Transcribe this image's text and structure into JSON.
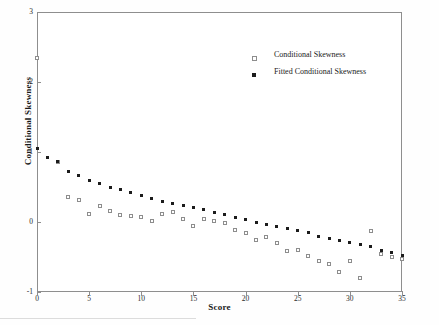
{
  "chart_data": {
    "type": "scatter",
    "title": "",
    "xlabel": "Score",
    "ylabel": "Conditional Skewness",
    "xlim": [
      0,
      35
    ],
    "ylim": [
      -1,
      3
    ],
    "xticks": [
      0,
      5,
      10,
      15,
      20,
      25,
      30,
      35
    ],
    "yticks": [
      -1,
      0,
      1,
      2,
      3
    ],
    "xtick_labels": [
      "0",
      "5",
      "10",
      "15",
      "20",
      "25",
      "30",
      "35"
    ],
    "ytick_labels": [
      "-1",
      "0",
      "1",
      "2",
      "3"
    ],
    "grid": false,
    "legend_position": "upper-center-right",
    "series": [
      {
        "name": "Conditional Skewness",
        "marker": "open-square",
        "color": "#8d8d8d",
        "x": [
          0,
          2,
          3,
          4,
          5,
          6,
          7,
          8,
          9,
          10,
          11,
          12,
          13,
          14,
          15,
          16,
          17,
          18,
          19,
          20,
          21,
          22,
          23,
          24,
          25,
          26,
          27,
          28,
          29,
          30,
          31,
          32,
          33,
          34,
          35
        ],
        "y": [
          2.35,
          0.86,
          0.36,
          0.31,
          0.12,
          0.23,
          0.16,
          0.1,
          0.09,
          0.07,
          0.01,
          0.11,
          0.14,
          0.04,
          -0.05,
          0.05,
          0.02,
          -0.01,
          -0.12,
          -0.15,
          -0.25,
          -0.22,
          -0.3,
          -0.42,
          -0.4,
          -0.48,
          -0.56,
          -0.6,
          -0.72,
          -0.56,
          -0.8,
          -0.13,
          -0.46,
          -0.5,
          -0.53
        ]
      },
      {
        "name": "Fitted Conditional Skewness",
        "marker": "filled-square",
        "color": "#1c1c1c",
        "x": [
          0,
          1,
          2,
          3,
          4,
          5,
          6,
          7,
          8,
          9,
          10,
          11,
          12,
          13,
          14,
          15,
          16,
          17,
          18,
          19,
          20,
          21,
          22,
          23,
          24,
          25,
          26,
          27,
          28,
          29,
          30,
          31,
          32,
          33,
          34,
          35
        ],
        "y": [
          1.05,
          0.92,
          0.86,
          0.72,
          0.66,
          0.59,
          0.55,
          0.5,
          0.46,
          0.42,
          0.38,
          0.34,
          0.3,
          0.27,
          0.24,
          0.21,
          0.18,
          0.14,
          0.11,
          0.07,
          0.03,
          0.0,
          -0.03,
          -0.06,
          -0.09,
          -0.12,
          -0.15,
          -0.2,
          -0.23,
          -0.26,
          -0.29,
          -0.32,
          -0.35,
          -0.4,
          -0.44,
          -0.48
        ]
      }
    ]
  },
  "legend": {
    "items": [
      {
        "label": "Conditional Skewness",
        "marker": "open-square"
      },
      {
        "label": "Fitted Conditional Skewness",
        "marker": "filled-square"
      }
    ]
  }
}
